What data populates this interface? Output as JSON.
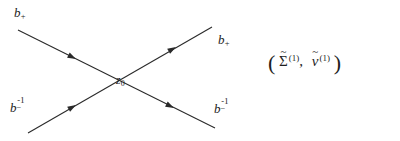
{
  "figure": {
    "type": "crossing-lines-diagram",
    "background_color": "#ffffff",
    "line_color": "#2a2a2a",
    "text_color": "#1e1e1e",
    "labels": {
      "top_left": {
        "base": "b",
        "sub": "+",
        "sup": ""
      },
      "bottom_left": {
        "base": "b",
        "sub": "−",
        "sup": "-1"
      },
      "top_right": {
        "base": "b",
        "sub": "+",
        "sup": ""
      },
      "bottom_right": {
        "base": "b",
        "sub": "−",
        "sup": "-1"
      },
      "center": {
        "base": "z",
        "sub": "0"
      }
    },
    "lines": [
      {
        "name": "descending-line",
        "from": [
          18,
          30
        ],
        "to": [
          215,
          128
        ],
        "direction": "down-right",
        "arrow_positions": [
          [
            72,
            50
          ],
          [
            170,
            103
          ]
        ]
      },
      {
        "name": "ascending-line",
        "from": [
          28,
          133
        ],
        "to": [
          212,
          27
        ],
        "direction": "up-right",
        "arrow_positions": [
          [
            72,
            105
          ],
          [
            172,
            53
          ]
        ]
      }
    ],
    "crossing_point": [
      122,
      73
    ]
  },
  "expression": {
    "open_paren": "(",
    "close_paren": ")",
    "comma": ",",
    "tilde": "~",
    "first_term": {
      "symbol": "Σ",
      "accent": "tilde",
      "superscript": "(1)"
    },
    "second_term": {
      "symbol": "v",
      "accent": "tilde",
      "superscript": "(1)"
    },
    "plain_text": "( Σ̃ (1), ṽ (1) )"
  }
}
